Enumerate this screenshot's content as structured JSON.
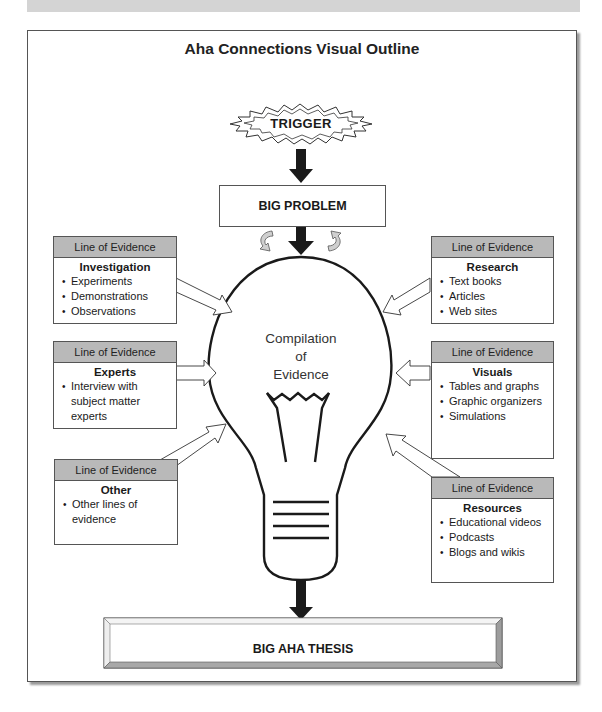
{
  "title": "Aha Connections Visual Outline",
  "trigger": {
    "label": "TRIGGER"
  },
  "big_problem": {
    "label": "BIG PROBLEM"
  },
  "bulb": {
    "line1": "Compilation",
    "line2": "of",
    "line3": "Evidence"
  },
  "thesis": {
    "label": "BIG AHA THESIS"
  },
  "evidence": [
    {
      "header": "Line of Evidence",
      "title": "Investigation",
      "items": [
        "Experiments",
        "Demonstrations",
        "Observations"
      ]
    },
    {
      "header": "Line of Evidence",
      "title": "Experts",
      "items": [
        "Interview with subject matter experts"
      ]
    },
    {
      "header": "Line of Evidence",
      "title": "Other",
      "items": [
        "Other lines of evidence"
      ]
    },
    {
      "header": "Line of Evidence",
      "title": "Research",
      "items": [
        "Text books",
        "Articles",
        "Web sites"
      ]
    },
    {
      "header": "Line of Evidence",
      "title": "Visuals",
      "items": [
        "Tables and graphs",
        "Graphic organizers",
        "Simulations"
      ]
    },
    {
      "header": "Line of Evidence",
      "title": "Resources",
      "items": [
        "Educational videos",
        "Podcasts",
        "Blogs and wikis"
      ]
    }
  ],
  "colors": {
    "header_fill": "#b9b9b9",
    "line": "#1a1a1a",
    "border": "#555555"
  }
}
